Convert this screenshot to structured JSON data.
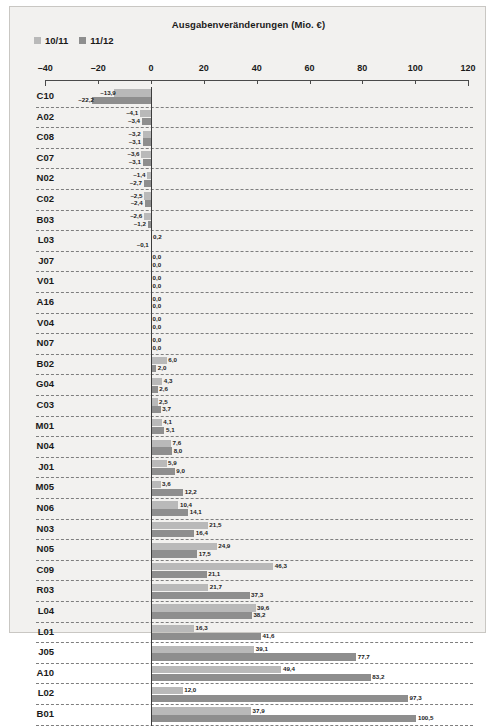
{
  "chart_data": {
    "type": "bar",
    "orientation": "horizontal",
    "title": "Ausgabenveränderungen (Mio. €)",
    "xlabel": "",
    "ylabel": "",
    "xlim": [
      -40,
      120
    ],
    "xticks": [
      -40,
      -20,
      0,
      20,
      40,
      60,
      80,
      100,
      120
    ],
    "xtick_labels": [
      "–40",
      "–20",
      "0",
      "20",
      "40",
      "60",
      "80",
      "100",
      "120"
    ],
    "grid": "horizontal-dashed",
    "legend_position": "top-left",
    "colors": {
      "series_10_11": "#b9b9b9",
      "series_11_12": "#8e8e8e",
      "background": "#f2f1ef",
      "axis": "#3d3d3d",
      "text": "#1a1a1a"
    },
    "categories": [
      "C10",
      "A02",
      "C08",
      "C07",
      "N02",
      "C02",
      "B03",
      "L03",
      "J07",
      "V01",
      "A16",
      "V04",
      "N07",
      "B02",
      "G04",
      "C03",
      "M01",
      "N04",
      "J01",
      "M05",
      "N06",
      "N03",
      "N05",
      "C09",
      "R03",
      "L04",
      "L01",
      "J05",
      "A10",
      "L02",
      "B01"
    ],
    "series": [
      {
        "name": "10/11",
        "values": [
          -13.9,
          -4.1,
          -3.2,
          -3.6,
          -1.4,
          -2.5,
          -2.6,
          0.2,
          0.0,
          0.0,
          0.0,
          0.0,
          0.0,
          6.0,
          4.3,
          2.5,
          4.1,
          7.6,
          5.9,
          3.6,
          10.4,
          21.5,
          24.9,
          46.3,
          21.7,
          39.6,
          16.3,
          39.1,
          49.4,
          12.0,
          37.9
        ],
        "labels": [
          "–13,9",
          "–4,1",
          "–3,2",
          "–3,6",
          "–1,4",
          "–2,5",
          "–2,6",
          "0,2",
          "0,0",
          "0,0",
          "0,0",
          "0,0",
          "0,0",
          "6,0",
          "4,3",
          "2,5",
          "4,1",
          "7,6",
          "5,9",
          "3,6",
          "10,4",
          "21,5",
          "24,9",
          "46,3",
          "21,7",
          "39,6",
          "16,3",
          "39,1",
          "49,4",
          "12,0",
          "37,9"
        ]
      },
      {
        "name": "11/12",
        "values": [
          -22.2,
          -3.4,
          -3.1,
          -3.1,
          -2.7,
          -2.4,
          -1.2,
          -0.1,
          0.0,
          0.0,
          0.0,
          0.0,
          0.0,
          2.0,
          2.6,
          3.7,
          5.1,
          8.0,
          9.0,
          12.2,
          14.1,
          16.4,
          17.5,
          21.1,
          37.3,
          38.2,
          41.6,
          77.7,
          83.2,
          97.3,
          100.5
        ],
        "labels": [
          "–22,2",
          "–3,4",
          "–3,1",
          "–3,1",
          "–2,7",
          "–2,4",
          "–1,2",
          "–0,1",
          "0,0",
          "0,0",
          "0,0",
          "0,0",
          "0,0",
          "2,0",
          "2,6",
          "3,7",
          "5,1",
          "8,0",
          "9,0",
          "12,2",
          "14,1",
          "16,4",
          "17,5",
          "21,1",
          "37,3",
          "38,2",
          "41,6",
          "77,7",
          "83,2",
          "97,3",
          "100,5"
        ]
      }
    ]
  }
}
